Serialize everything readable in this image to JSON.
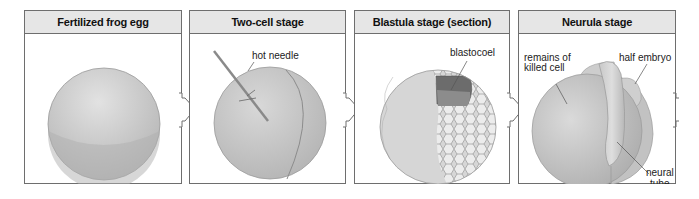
{
  "diagram": {
    "type": "stage-sequence",
    "colors": {
      "panel_border": "#6e6e6e",
      "header_fill": "#e6e6e6",
      "embryo_fill": "#c8c8c8",
      "embryo_shadow": "#b4b4b4",
      "blastocoel_fill": "#6f6f6f",
      "needle": "#888888"
    },
    "panels": [
      {
        "title": "Fertilized frog egg",
        "labels": []
      },
      {
        "title": "Two-cell stage",
        "labels": [
          "hot needle"
        ]
      },
      {
        "title": "Blastula stage (section)",
        "labels": [
          "blastocoel"
        ]
      },
      {
        "title": "Neurula stage",
        "labels": [
          "remains of",
          "killed cell",
          "half embryo",
          "neural",
          "tube"
        ]
      }
    ],
    "arrows": [
      "arrow-1-to-2",
      "arrow-2-to-3",
      "arrow-3-to-4"
    ]
  }
}
